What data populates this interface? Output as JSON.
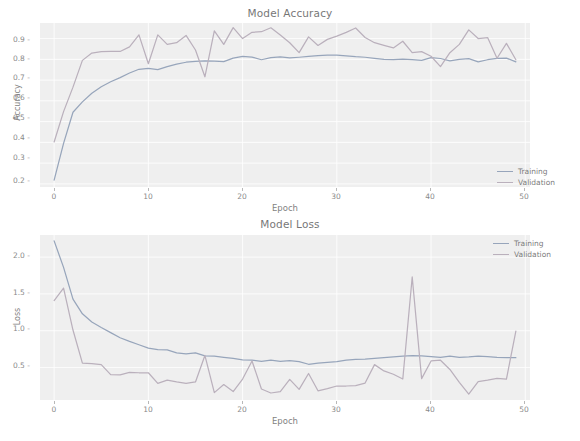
{
  "figure": {
    "background": "#ffffff",
    "plot_background": "#e9e9e9",
    "grid_color": "#ffffff"
  },
  "colors": {
    "training": "#6b7f9e",
    "validation": "#9d8fa0",
    "text": "#3a3a3a",
    "tick": "#555555"
  },
  "legend": {
    "training_label": "Training",
    "validation_label": "Validation"
  },
  "accuracy": {
    "title": "Model Accuracy",
    "xlabel": "Epoch",
    "ylabel": "Accuracy",
    "yticks": [
      "0.9",
      "0.8",
      "0.7",
      "0.6",
      "0.5",
      "0.4",
      "0.3",
      "0.2"
    ],
    "xticks": [
      "0",
      "10",
      "20",
      "30",
      "40",
      "50"
    ]
  },
  "loss": {
    "title": "Model Loss",
    "xlabel": "Epoch",
    "ylabel": "Loss",
    "yticks": [
      "2.0",
      "1.5",
      "1.0",
      "0.5"
    ],
    "xticks": [
      "0",
      "10",
      "20",
      "30",
      "40",
      "50"
    ]
  },
  "chart_data": [
    {
      "type": "line",
      "title": "Model Accuracy",
      "xlabel": "Epoch",
      "ylabel": "Accuracy",
      "xlim": [
        -1.5,
        50.5
      ],
      "ylim": [
        0.185,
        0.975
      ],
      "grid": true,
      "legend_position": "lower right",
      "x": [
        0,
        1,
        2,
        3,
        4,
        5,
        6,
        7,
        8,
        9,
        10,
        11,
        12,
        13,
        14,
        15,
        16,
        17,
        18,
        19,
        20,
        21,
        22,
        23,
        24,
        25,
        26,
        27,
        28,
        29,
        30,
        31,
        32,
        33,
        34,
        35,
        36,
        37,
        38,
        39,
        40,
        41,
        42,
        43,
        44,
        45,
        46,
        47,
        48,
        49
      ],
      "series": [
        {
          "name": "Training",
          "color": "#6b7f9e",
          "values": [
            0.218,
            0.395,
            0.545,
            0.595,
            0.637,
            0.668,
            0.692,
            0.712,
            0.734,
            0.752,
            0.757,
            0.75,
            0.765,
            0.777,
            0.786,
            0.79,
            0.792,
            0.791,
            0.789,
            0.806,
            0.814,
            0.811,
            0.798,
            0.808,
            0.812,
            0.807,
            0.81,
            0.814,
            0.818,
            0.82,
            0.82,
            0.817,
            0.813,
            0.81,
            0.805,
            0.8,
            0.798,
            0.801,
            0.798,
            0.795,
            0.808,
            0.804,
            0.793,
            0.8,
            0.803,
            0.788,
            0.798,
            0.805,
            0.806,
            0.788
          ]
        },
        {
          "name": "Validation",
          "color": "#9d8fa0",
          "values": [
            0.402,
            0.548,
            0.666,
            0.795,
            0.83,
            0.837,
            0.838,
            0.838,
            0.86,
            0.918,
            0.779,
            0.918,
            0.872,
            0.88,
            0.915,
            0.845,
            0.716,
            0.937,
            0.872,
            0.953,
            0.9,
            0.93,
            0.933,
            0.952,
            0.917,
            0.88,
            0.832,
            0.908,
            0.867,
            0.896,
            0.912,
            0.93,
            0.951,
            0.905,
            0.88,
            0.867,
            0.855,
            0.887,
            0.832,
            0.837,
            0.815,
            0.765,
            0.832,
            0.872,
            0.942,
            0.9,
            0.905,
            0.805,
            0.877,
            0.798
          ]
        }
      ]
    },
    {
      "type": "line",
      "title": "Model Loss",
      "xlabel": "Epoch",
      "ylabel": "Loss",
      "xlim": [
        -1.5,
        50.5
      ],
      "ylim": [
        0.06,
        2.3
      ],
      "grid": true,
      "legend_position": "upper right",
      "x": [
        0,
        1,
        2,
        3,
        4,
        5,
        6,
        7,
        8,
        9,
        10,
        11,
        12,
        13,
        14,
        15,
        16,
        17,
        18,
        19,
        20,
        21,
        22,
        23,
        24,
        25,
        26,
        27,
        28,
        29,
        30,
        31,
        32,
        33,
        34,
        35,
        36,
        37,
        38,
        39,
        40,
        41,
        42,
        43,
        44,
        45,
        46,
        47,
        48,
        49
      ],
      "series": [
        {
          "name": "Training",
          "color": "#6b7f9e",
          "values": [
            2.22,
            1.86,
            1.43,
            1.23,
            1.12,
            1.045,
            0.975,
            0.905,
            0.855,
            0.81,
            0.765,
            0.745,
            0.74,
            0.7,
            0.685,
            0.7,
            0.66,
            0.655,
            0.64,
            0.625,
            0.605,
            0.6,
            0.585,
            0.6,
            0.585,
            0.595,
            0.58,
            0.545,
            0.56,
            0.57,
            0.58,
            0.6,
            0.61,
            0.615,
            0.625,
            0.635,
            0.645,
            0.655,
            0.662,
            0.66,
            0.65,
            0.64,
            0.655,
            0.64,
            0.645,
            0.655,
            0.65,
            0.64,
            0.635,
            0.635
          ]
        },
        {
          "name": "Validation",
          "color": "#9d8fa0",
          "values": [
            1.41,
            1.58,
            1.01,
            0.56,
            0.555,
            0.54,
            0.405,
            0.4,
            0.435,
            0.43,
            0.43,
            0.285,
            0.33,
            0.305,
            0.285,
            0.305,
            0.665,
            0.16,
            0.27,
            0.175,
            0.345,
            0.59,
            0.21,
            0.155,
            0.175,
            0.34,
            0.205,
            0.42,
            0.185,
            0.215,
            0.25,
            0.25,
            0.255,
            0.29,
            0.54,
            0.455,
            0.41,
            0.345,
            1.73,
            0.35,
            0.59,
            0.6,
            0.475,
            0.3,
            0.14,
            0.31,
            0.33,
            0.355,
            0.345,
            0.995
          ]
        }
      ]
    }
  ]
}
